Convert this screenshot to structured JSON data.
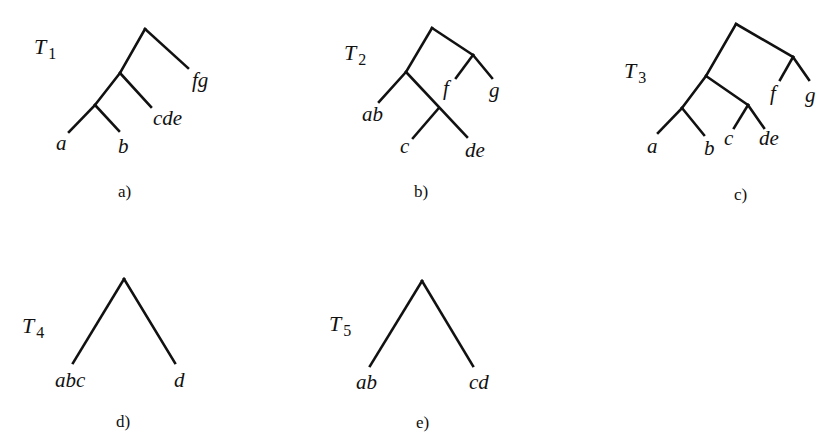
{
  "figure": {
    "trees": [
      {
        "id": "T1",
        "name": "T",
        "subscript": "1",
        "caption": "a)",
        "leaves": [
          "a",
          "b",
          "cde",
          "fg"
        ],
        "edges": [
          [
            145,
            29,
            188,
            68
          ],
          [
            145,
            29,
            120,
            73
          ],
          [
            120,
            73,
            151,
            107
          ],
          [
            120,
            73,
            95,
            105
          ],
          [
            95,
            105,
            69,
            132
          ],
          [
            95,
            105,
            119,
            131
          ]
        ]
      },
      {
        "id": "T2",
        "name": "T",
        "subscript": "2",
        "caption": "b)",
        "leaves": [
          "ab",
          "c",
          "de",
          "f",
          "g"
        ],
        "edges": [
          [
            432,
            28,
            473,
            55
          ],
          [
            473,
            55,
            492,
            78
          ],
          [
            473,
            55,
            456,
            78
          ],
          [
            432,
            28,
            406,
            72
          ],
          [
            406,
            72,
            379,
            102
          ],
          [
            406,
            72,
            467,
            137
          ],
          [
            438,
            109,
            413,
            138
          ]
        ]
      },
      {
        "id": "T3",
        "name": "T",
        "subscript": "3",
        "caption": "c)",
        "leaves": [
          "a",
          "b",
          "c",
          "de",
          "f",
          "g"
        ],
        "edges": [
          [
            736,
            24,
            793,
            57
          ],
          [
            793,
            57,
            809,
            80
          ],
          [
            793,
            57,
            780,
            80
          ],
          [
            736,
            24,
            706,
            76
          ],
          [
            706,
            76,
            748,
            105
          ],
          [
            748,
            105,
            764,
            128
          ],
          [
            748,
            105,
            734,
            128
          ],
          [
            706,
            76,
            682,
            108
          ],
          [
            682,
            108,
            658,
            133
          ],
          [
            682,
            108,
            704,
            135
          ]
        ]
      },
      {
        "id": "T4",
        "name": "T",
        "subscript": "4",
        "caption": "d)",
        "leaves": [
          "abc",
          "d"
        ],
        "edges": [
          [
            124,
            279,
            73,
            363
          ],
          [
            124,
            279,
            175,
            363
          ]
        ]
      },
      {
        "id": "T5",
        "name": "T",
        "subscript": "5",
        "caption": "e)",
        "leaves": [
          "ab",
          "cd"
        ],
        "edges": [
          [
            422,
            281,
            370,
            366
          ],
          [
            422,
            281,
            473,
            366
          ]
        ]
      }
    ],
    "labels": {
      "t1": {
        "a": "a",
        "b": "b",
        "cde": "cde",
        "fg": "fg"
      },
      "t2": {
        "ab": "ab",
        "c": "c",
        "de": "de",
        "f": "f",
        "g": "g"
      },
      "t3": {
        "a": "a",
        "b": "b",
        "c": "c",
        "de": "de",
        "f": "f",
        "g": "g"
      },
      "t4": {
        "abc": "abc",
        "d": "d"
      },
      "t5": {
        "ab": "ab",
        "cd": "cd"
      }
    },
    "captions": {
      "a": "a)",
      "b": "b)",
      "c": "c)",
      "d": "d)",
      "e": "e)"
    },
    "tree_names": {
      "t1": {
        "letter": "T",
        "sub": "1"
      },
      "t2": {
        "letter": "T",
        "sub": "2"
      },
      "t3": {
        "letter": "T",
        "sub": "3"
      },
      "t4": {
        "letter": "T",
        "sub": "4"
      },
      "t5": {
        "letter": "T",
        "sub": "5"
      }
    },
    "stroke_color": "#111111",
    "background": "#ffffff"
  }
}
